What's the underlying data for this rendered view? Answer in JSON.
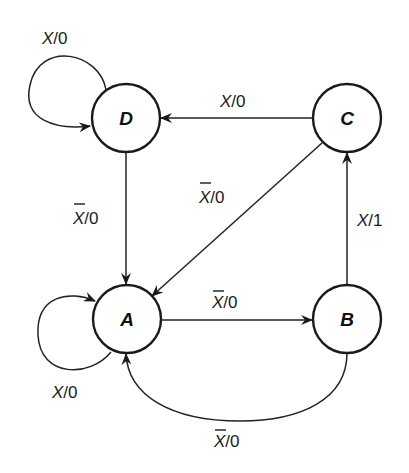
{
  "diagram": {
    "type": "state-transition-diagram",
    "colors": {
      "stroke": "#1a1a1a",
      "background": "#ffffff"
    },
    "states": [
      {
        "id": "A",
        "label": "A",
        "cx": 127,
        "cy": 319,
        "r": 34
      },
      {
        "id": "B",
        "label": "B",
        "cx": 347,
        "cy": 319,
        "r": 34
      },
      {
        "id": "C",
        "label": "C",
        "cx": 347,
        "cy": 118,
        "r": 34
      },
      {
        "id": "D",
        "label": "D",
        "cx": 126,
        "cy": 118,
        "r": 34
      }
    ],
    "transitions": [
      {
        "from": "D",
        "to": "D",
        "input": "X",
        "input_negated": false,
        "output": "0",
        "label": "X/0"
      },
      {
        "from": "C",
        "to": "D",
        "input": "X",
        "input_negated": false,
        "output": "0",
        "label": "X/0"
      },
      {
        "from": "D",
        "to": "A",
        "input": "X",
        "input_negated": true,
        "output": "0",
        "label": "X̄/0"
      },
      {
        "from": "C",
        "to": "A",
        "input": "X",
        "input_negated": true,
        "output": "0",
        "label": "X̄/0"
      },
      {
        "from": "B",
        "to": "C",
        "input": "X",
        "input_negated": false,
        "output": "1",
        "label": "X/1"
      },
      {
        "from": "A",
        "to": "A",
        "input": "X",
        "input_negated": false,
        "output": "0",
        "label": "X/0"
      },
      {
        "from": "A",
        "to": "B",
        "input": "X",
        "input_negated": true,
        "output": "0",
        "label": "X̄/0"
      },
      {
        "from": "B",
        "to": "A",
        "input": "X",
        "input_negated": true,
        "output": "0",
        "label": "X̄/0"
      }
    ],
    "labels": {
      "state_a": "A",
      "state_b": "B",
      "state_c": "C",
      "state_d": "D",
      "d_loop_input": "X",
      "d_loop_output": "/0",
      "c_to_d_input": "X",
      "c_to_d_output": "/0",
      "d_to_a_input": "X",
      "d_to_a_output": "/0",
      "c_to_a_input": "X",
      "c_to_a_output": "/0",
      "b_to_c_input": "X",
      "b_to_c_output": "/1",
      "a_loop_input": "X",
      "a_loop_output": "/0",
      "a_to_b_input": "X",
      "a_to_b_output": "/0",
      "b_to_a_input": "X",
      "b_to_a_output": "/0"
    }
  }
}
